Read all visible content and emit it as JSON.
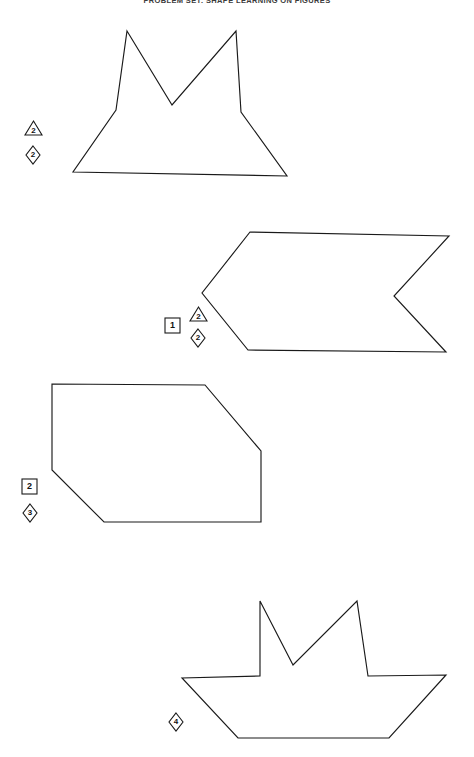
{
  "page": {
    "title": "PROBLEM SET: SHAPE LEARNING ON FIGURES",
    "width": 474,
    "height": 757,
    "background_color": "#ffffff",
    "stroke_color": "#1a1a1a"
  },
  "figures": [
    {
      "id": "figure-1",
      "name": "star-house-polygon",
      "description": "Concave polygon resembling a two-peaked crown over a wide trapezoid base",
      "points": "127,31 172,105 236,31 241,112 287,176 73,172 116,110",
      "labels": [
        {
          "type": "triangle",
          "value": "2",
          "x": 24,
          "y": 120
        },
        {
          "type": "diamond",
          "value": "2",
          "x": 25,
          "y": 145
        }
      ]
    },
    {
      "id": "figure-2",
      "name": "banner-ribbon-polygon",
      "description": "Right-pointing banner with a notched right edge and a pointed left edge",
      "points": "250,232 449,236 394,296 446,352 248,350 202,293",
      "labels": [
        {
          "type": "square",
          "value": "1",
          "x": 164,
          "y": 317
        },
        {
          "type": "triangle",
          "value": "2",
          "x": 189,
          "y": 306
        },
        {
          "type": "diamond",
          "value": "2",
          "x": 190,
          "y": 328
        }
      ]
    },
    {
      "id": "figure-3",
      "name": "clipped-corner-hexagon",
      "description": "Hexagon with the top-right and bottom-left corners cut off",
      "points": "52,384 205,385 261,451 261,522 104,522 52,470",
      "labels": [
        {
          "type": "square",
          "value": "2",
          "x": 21,
          "y": 478
        },
        {
          "type": "diamond",
          "value": "3",
          "x": 22,
          "y": 503
        }
      ]
    },
    {
      "id": "figure-4",
      "name": "boat-crown-polygon",
      "description": "Concave polygon resembling a boat hull with two upward peaks",
      "points": "260,601 293,665 357,601 368,676 446,675 389,738 238,738 182,678 260,676",
      "labels": [
        {
          "type": "diamond",
          "value": "4",
          "x": 168,
          "y": 712
        }
      ]
    }
  ],
  "legend": {
    "square_meaning": "square-badge",
    "triangle_meaning": "triangle-badge",
    "diamond_meaning": "diamond-badge"
  }
}
